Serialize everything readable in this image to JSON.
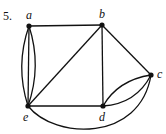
{
  "problem_number": "5.",
  "graph": {
    "nodes": [
      {
        "id": "a",
        "label": "a",
        "x": 29,
        "y": 26
      },
      {
        "id": "b",
        "label": "b",
        "x": 102,
        "y": 25
      },
      {
        "id": "c",
        "label": "c",
        "x": 151,
        "y": 75
      },
      {
        "id": "d",
        "label": "d",
        "x": 103,
        "y": 106
      },
      {
        "id": "e",
        "label": "e",
        "x": 28,
        "y": 106
      }
    ],
    "edges": [
      {
        "from": "a",
        "to": "b",
        "shape": "straight"
      },
      {
        "from": "a",
        "to": "e",
        "shape": "straight"
      },
      {
        "from": "a",
        "to": "e",
        "shape": "curve-left"
      },
      {
        "from": "a",
        "to": "e",
        "shape": "curve-right"
      },
      {
        "from": "b",
        "to": "e",
        "shape": "straight"
      },
      {
        "from": "b",
        "to": "d",
        "shape": "straight"
      },
      {
        "from": "b",
        "to": "c",
        "shape": "straight"
      },
      {
        "from": "e",
        "to": "d",
        "shape": "straight"
      },
      {
        "from": "d",
        "to": "c",
        "shape": "curve-upper"
      },
      {
        "from": "d",
        "to": "c",
        "shape": "curve-lower"
      },
      {
        "from": "e",
        "to": "c",
        "shape": "arc-below"
      }
    ],
    "colors": {
      "stroke": "#111111",
      "background": "#ffffff"
    }
  }
}
